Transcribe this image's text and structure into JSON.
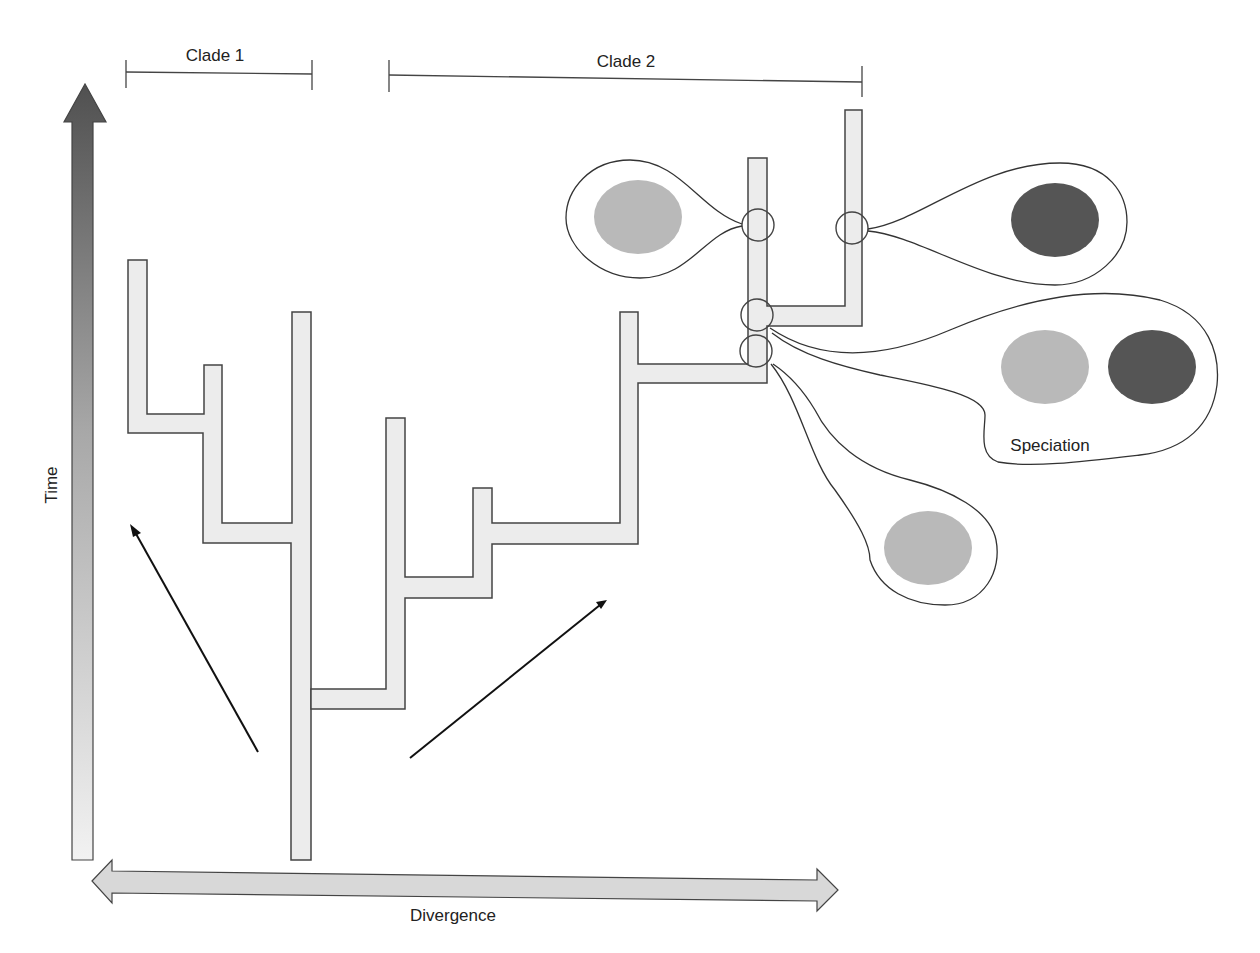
{
  "diagram": {
    "type": "phylogenetic-tree",
    "axes": {
      "time_label": "Time",
      "divergence_label": "Divergence"
    },
    "clades": [
      {
        "label": "Clade 1"
      },
      {
        "label": "Clade 2"
      }
    ],
    "annotations": {
      "speciation_label": "Speciation"
    },
    "colors": {
      "branch_fill": "#ececec",
      "outline": "#444444",
      "population_light": "#b9b9b9",
      "population_dark": "#555555",
      "time_arrow_top": "#555555",
      "time_arrow_bottom": "#f0f0f0",
      "divergence_arrow": "#d8d8d8"
    },
    "populations": [
      {
        "bubble": "upper-left",
        "shade": "light",
        "count": 1
      },
      {
        "bubble": "upper-right",
        "shade": "dark",
        "count": 1
      },
      {
        "bubble": "speciation",
        "shades": [
          "light",
          "dark"
        ],
        "count": 2
      },
      {
        "bubble": "lower",
        "shade": "light",
        "count": 1
      }
    ]
  }
}
